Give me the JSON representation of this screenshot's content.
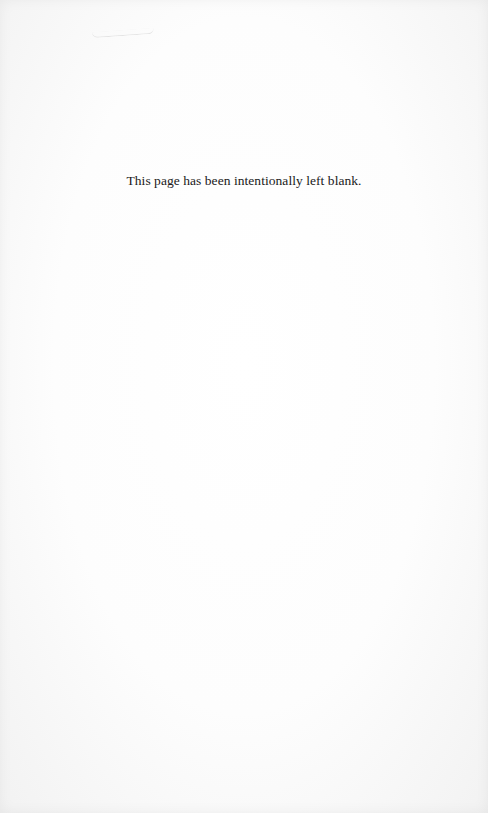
{
  "page": {
    "notice_text": "This page has been intentionally left blank.",
    "background_color": "#fdfdfd",
    "text_color": "#1a1a1a"
  }
}
